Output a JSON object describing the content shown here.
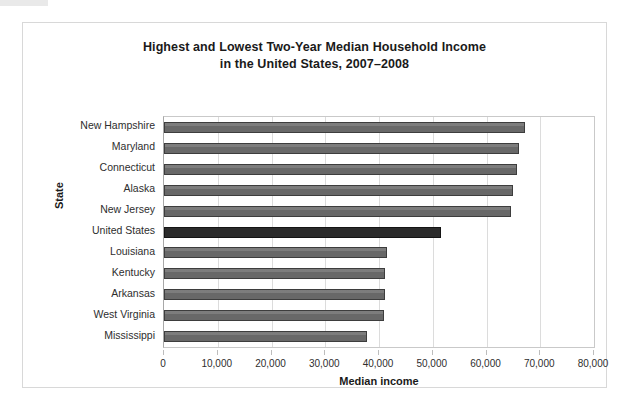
{
  "chart_data": {
    "type": "bar",
    "orientation": "horizontal",
    "title": "Highest and Lowest Two-Year Median Household Income",
    "subtitle": "in the United States, 2007–2008",
    "xlabel": "Median income",
    "ylabel": "State",
    "xlim": [
      0,
      80000
    ],
    "xticks": [
      0,
      10000,
      20000,
      30000,
      40000,
      50000,
      60000,
      70000,
      80000
    ],
    "xtick_labels": [
      "0",
      "10,000",
      "20,000",
      "30,000",
      "40,000",
      "50,000",
      "60,000",
      "70,000",
      "80,000"
    ],
    "grid": true,
    "legend": false,
    "categories": [
      "New Hampshire",
      "Maryland",
      "Connecticut",
      "Alaska",
      "New Jersey",
      "United States",
      "Louisiana",
      "Kentucky",
      "Arkansas",
      "West Virginia",
      "Mississippi"
    ],
    "values": [
      67200,
      66000,
      65700,
      65000,
      64600,
      51500,
      41400,
      41200,
      41100,
      40900,
      37700
    ],
    "highlight_category": "United States",
    "colors": {
      "bar": "#6e6e6e",
      "bar_border": "#3d3d3d",
      "highlight_bar": "#2b2b2b",
      "highlight_border": "#141414",
      "grid": "#dcdcdc",
      "axis": "#c9c9c9",
      "frame": "#d8d8d8",
      "text": "#1a1a1a",
      "background": "#ffffff"
    }
  }
}
